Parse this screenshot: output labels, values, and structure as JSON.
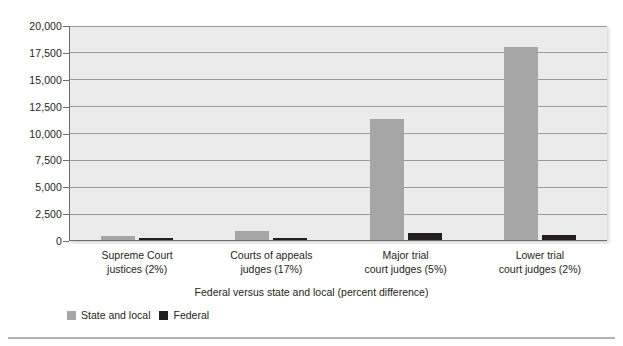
{
  "chart_data": {
    "type": "bar",
    "title": "",
    "xlabel": "Federal versus state and local (percent difference)",
    "ylabel": "",
    "categories": [
      "Supreme Court justices (2%)",
      "Courts of appeals judges (17%)",
      "Major trial court judges (5%)",
      "Lower trial court judges (2%)"
    ],
    "category_lines": [
      [
        "Supreme Court",
        "justices (2%)"
      ],
      [
        "Courts of appeals",
        "judges (17%)"
      ],
      [
        "Major trial",
        "court judges (5%)"
      ],
      [
        "Lower trial",
        "court judges (2%)"
      ]
    ],
    "series": [
      {
        "name": "State and local",
        "color": "#a6a6a6",
        "values": [
          350,
          870,
          11300,
          18000
        ]
      },
      {
        "name": "Federal",
        "color": "#231f20",
        "values": [
          9,
          180,
          650,
          450
        ]
      }
    ],
    "ylim": [
      0,
      20000
    ],
    "ytick_values": [
      0,
      2500,
      5000,
      7500,
      10000,
      12500,
      15000,
      17500,
      20000
    ],
    "ytick_labels": [
      "0",
      "2,500",
      "5,000",
      "7,500",
      "10,000",
      "12,500",
      "15,000",
      "17,500",
      "20,000"
    ],
    "grid": "horizontal",
    "legend_position": "bottom-left",
    "plot_background": "#ebebeb",
    "axis_color": "#6e6e6e",
    "gridline_color": "#9a9a9a"
  }
}
